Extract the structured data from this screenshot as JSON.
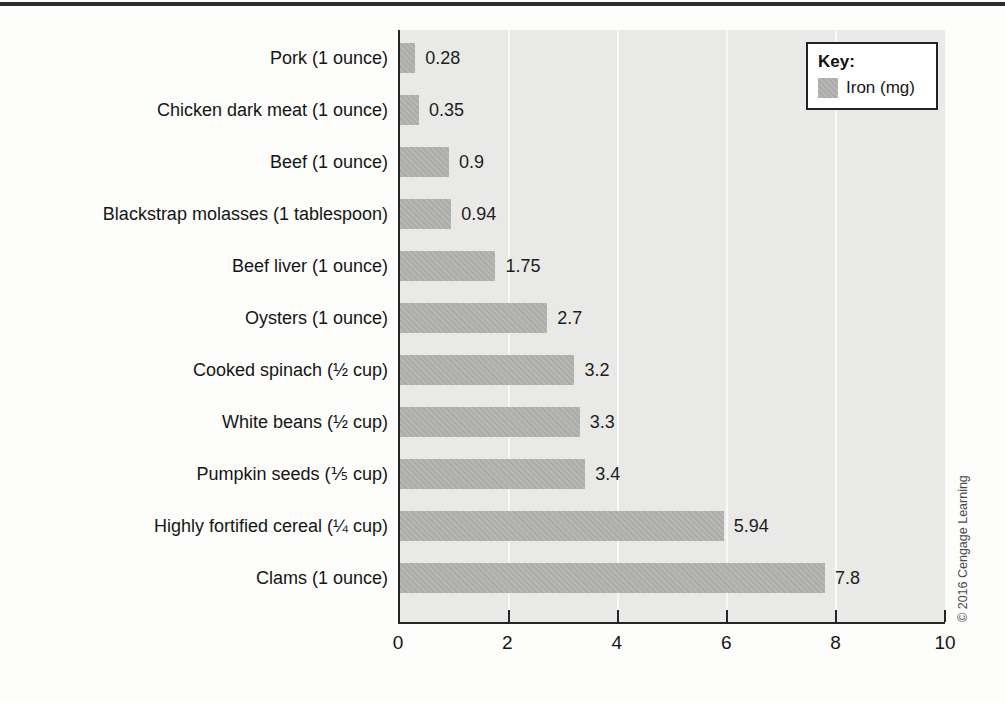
{
  "page": {
    "copyright": "© 2016 Cengage Learning"
  },
  "legend": {
    "title": "Key:",
    "series_label": "Iron (mg)"
  },
  "chart_data": {
    "type": "bar",
    "orientation": "horizontal",
    "title": "",
    "xlabel": "",
    "ylabel": "",
    "categories": [
      "Pork (1 ounce)",
      "Chicken dark meat (1 ounce)",
      "Beef (1 ounce)",
      "Blackstrap molasses (1 tablespoon)",
      "Beef liver (1 ounce)",
      "Oysters (1 ounce)",
      "Cooked spinach (½ cup)",
      "White beans (½ cup)",
      "Pumpkin seeds (⅕ cup)",
      "Highly fortified cereal (¼ cup)",
      "Clams (1 ounce)"
    ],
    "series": [
      {
        "name": "Iron (mg)",
        "values": [
          0.28,
          0.35,
          0.9,
          0.94,
          1.75,
          2.7,
          3.2,
          3.3,
          3.4,
          5.94,
          7.8
        ],
        "value_labels": [
          "0.28",
          "0.35",
          "0.9",
          "0.94",
          "1.75",
          "2.7",
          "3.2",
          "3.3",
          "3.4",
          "5.94",
          "7.8"
        ]
      }
    ],
    "xlim": [
      0,
      10
    ],
    "x_ticks": [
      0,
      2,
      4,
      6,
      8,
      10
    ],
    "grid": "faint white vertical gridlines at x = 2, 4, 6, 8",
    "legend_position": "top-right",
    "colors": {
      "bar": "#b3b3b2",
      "plot_background": "#e9e9e7",
      "axis": "#262626",
      "gridline": "#f8f8f6",
      "text": "#161616"
    }
  }
}
